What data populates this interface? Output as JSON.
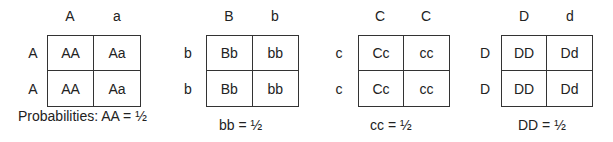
{
  "squares": [
    {
      "columns": [
        "A",
        "a"
      ],
      "rows": [
        "A",
        "A"
      ],
      "cells": [
        [
          "AA",
          "Aa"
        ],
        [
          "AA",
          "Aa"
        ]
      ],
      "caption": "Probabilities: AA = ½"
    },
    {
      "columns": [
        "B",
        "b"
      ],
      "rows": [
        "b",
        "b"
      ],
      "cells": [
        [
          "Bb",
          "bb"
        ],
        [
          "Bb",
          "bb"
        ]
      ],
      "caption": "bb = ½"
    },
    {
      "columns": [
        "C",
        "C"
      ],
      "rows": [
        "c",
        "c"
      ],
      "cells": [
        [
          "Cc",
          "cc"
        ],
        [
          "Cc",
          "cc"
        ]
      ],
      "caption": "cc = ½"
    },
    {
      "columns": [
        "D",
        "d"
      ],
      "rows": [
        "D",
        "D"
      ],
      "cells": [
        [
          "DD",
          "Dd"
        ],
        [
          "DD",
          "Dd"
        ]
      ],
      "caption": "DD = ½"
    }
  ]
}
